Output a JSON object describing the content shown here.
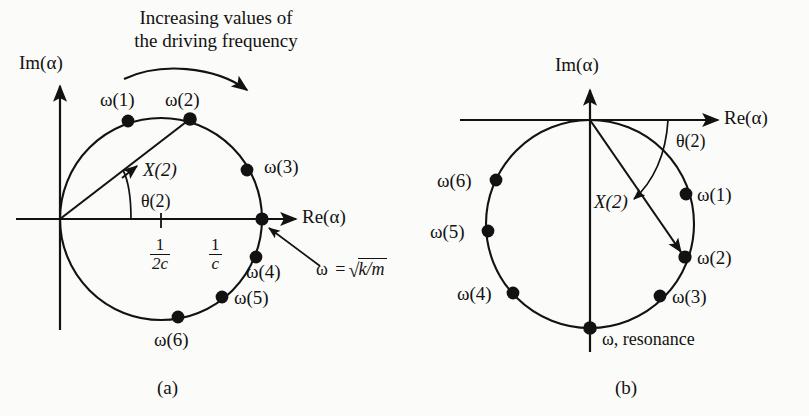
{
  "figure": {
    "background_color": "#fbfbf9",
    "ink_color": "#121212",
    "annotation_top": {
      "line1": "Increasing values of",
      "line2": "the driving frequency",
      "arrow_icon": "curved-arrow-clockwise-icon"
    },
    "panels": [
      {
        "id": "a",
        "caption": "(a)",
        "axes": {
          "imaginary_label": "Im(α)",
          "real_label": "Re(α)",
          "imaginary_arrow_icon": "axis-arrow-up-icon",
          "real_arrow_arrow_icon": "axis-arrow-right-icon"
        },
        "circle": {
          "center_x": 161,
          "center_y": 219,
          "radius": 101
        },
        "vector": {
          "label": "X(2)",
          "angle_label": "θ(2)"
        },
        "tick_labels": [
          {
            "numerator": "1",
            "denominator": "2c"
          },
          {
            "numerator": "1",
            "denominator": "c"
          }
        ],
        "resonance_note": {
          "omega": "ω",
          "equals": "=",
          "radical": "√",
          "radicand": "k/m"
        },
        "points": [
          {
            "label": "ω(1)",
            "x": 128,
            "y": 121
          },
          {
            "label": "ω(2)",
            "x": 190,
            "y": 119
          },
          {
            "label": "ω(3)",
            "x": 247,
            "y": 170
          },
          {
            "label": "ω(4)",
            "x": 256,
            "y": 257
          },
          {
            "label": "ω(5)",
            "x": 222,
            "y": 297
          },
          {
            "label": "ω(6)",
            "x": 178,
            "y": 317
          },
          {
            "label": "",
            "x": 262,
            "y": 219
          }
        ]
      },
      {
        "id": "b",
        "caption": "(b)",
        "axes": {
          "imaginary_label": "Im(α)",
          "real_label": "Re(α)",
          "imaginary_arrow_icon": "axis-arrow-up-icon",
          "real_arrow_arrow_icon": "axis-arrow-right-icon"
        },
        "circle": {
          "center_x": 590,
          "center_y": 224,
          "radius": 104
        },
        "vector": {
          "label": "X(2)",
          "angle_label": "θ(2)"
        },
        "resonance_label": "ω, resonance",
        "points": [
          {
            "label": "ω(1)",
            "x": 686,
            "y": 194
          },
          {
            "label": "ω(2)",
            "x": 685,
            "y": 257
          },
          {
            "label": "ω(3)",
            "x": 660,
            "y": 296
          },
          {
            "label": "ω(4)",
            "x": 513,
            "y": 293
          },
          {
            "label": "ω(5)",
            "x": 488,
            "y": 231
          },
          {
            "label": "ω(6)",
            "x": 496,
            "y": 180
          },
          {
            "label": "",
            "x": 590,
            "y": 328
          }
        ]
      }
    ]
  }
}
